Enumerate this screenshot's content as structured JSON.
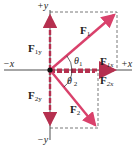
{
  "diagram": {
    "axes": {
      "pos_y": "+y",
      "neg_y": "−y",
      "pos_x": "+x",
      "neg_x": "−x"
    },
    "vectors": [
      {
        "name": "F",
        "sub": "1",
        "label": "F1",
        "angle_label": "θ",
        "angle_sub": "1"
      },
      {
        "name": "F",
        "sub": "2",
        "label": "F2",
        "angle_label": "θ",
        "angle_sub": " 2"
      }
    ],
    "components": {
      "f1x": {
        "name": "F",
        "sub": "1x"
      },
      "f1y": {
        "name": "F",
        "sub": "1y"
      },
      "f2x": {
        "name": "F",
        "sub": "2x"
      },
      "f2y": {
        "name": "F",
        "sub": "2y"
      }
    },
    "colors": {
      "vector": "#d9416b",
      "component": "#b5304f",
      "axis": "#222222",
      "dashed_box": "#555555"
    }
  }
}
